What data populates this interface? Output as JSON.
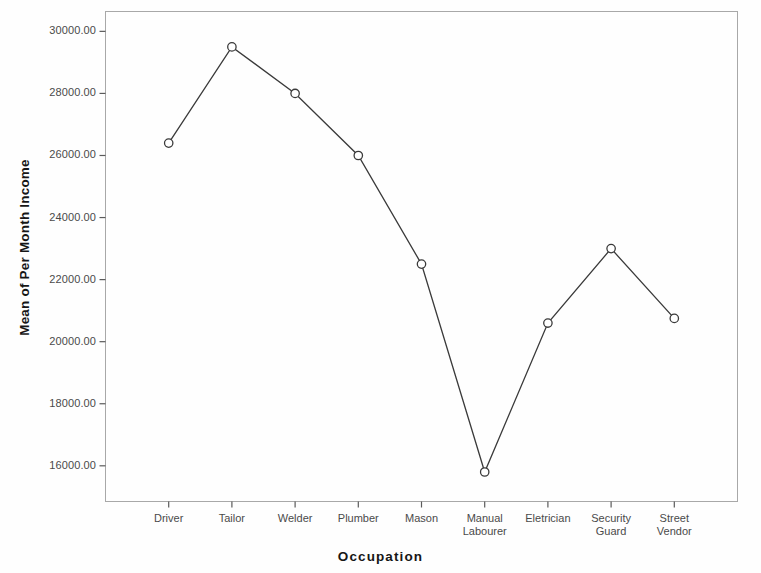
{
  "chart_data": {
    "type": "line",
    "title": "",
    "xlabel": "Occupation",
    "ylabel": "Mean of Per Month Income",
    "categories": [
      "Driver",
      "Tailor",
      "Welder",
      "Plumber",
      "Mason",
      "Manual\nLabourer",
      "Eletrician",
      "Security\nGuard",
      "Street\nVendor"
    ],
    "values": [
      26400,
      29500,
      28000,
      26000,
      22500,
      15800,
      20600,
      23000,
      20750
    ],
    "series": [
      {
        "name": "Mean of Per Month Income",
        "values": [
          26400,
          29500,
          28000,
          26000,
          22500,
          15800,
          20600,
          23000,
          20750
        ]
      }
    ],
    "ytick_labels": [
      "30000.00",
      "28000.00",
      "26000.00",
      "24000.00",
      "22000.00",
      "20000.00",
      "18000.00",
      "16000.00"
    ],
    "ytick_values": [
      30000,
      28000,
      26000,
      24000,
      22000,
      20000,
      18000,
      16000
    ],
    "ylim": [
      14850,
      30640
    ],
    "grid": false,
    "legend": false,
    "marker": "open-circle",
    "line_color": "#3a3a3a",
    "marker_color": "#3a3a3a",
    "axis_color": "#9a9a9a",
    "frame": true
  },
  "axis_titles": {
    "x": "Occupation",
    "y": "Mean of Per Month Income"
  }
}
